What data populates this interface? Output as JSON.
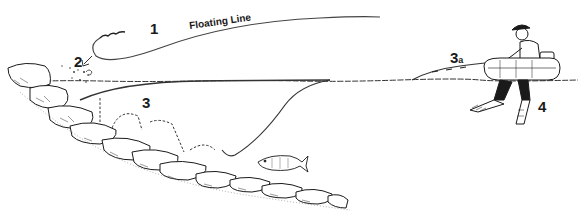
{
  "diagram": {
    "labels": {
      "floating_line": "Floating Line",
      "step1": "1",
      "step2": "2",
      "step3": "3",
      "step3a_main": "3",
      "step3a_sub": "a",
      "step4": "4"
    },
    "colors": {
      "ink": "#1a1a1a",
      "line": "#444444",
      "background": "#ffffff",
      "rock_shade": "#8a8a8a"
    }
  }
}
